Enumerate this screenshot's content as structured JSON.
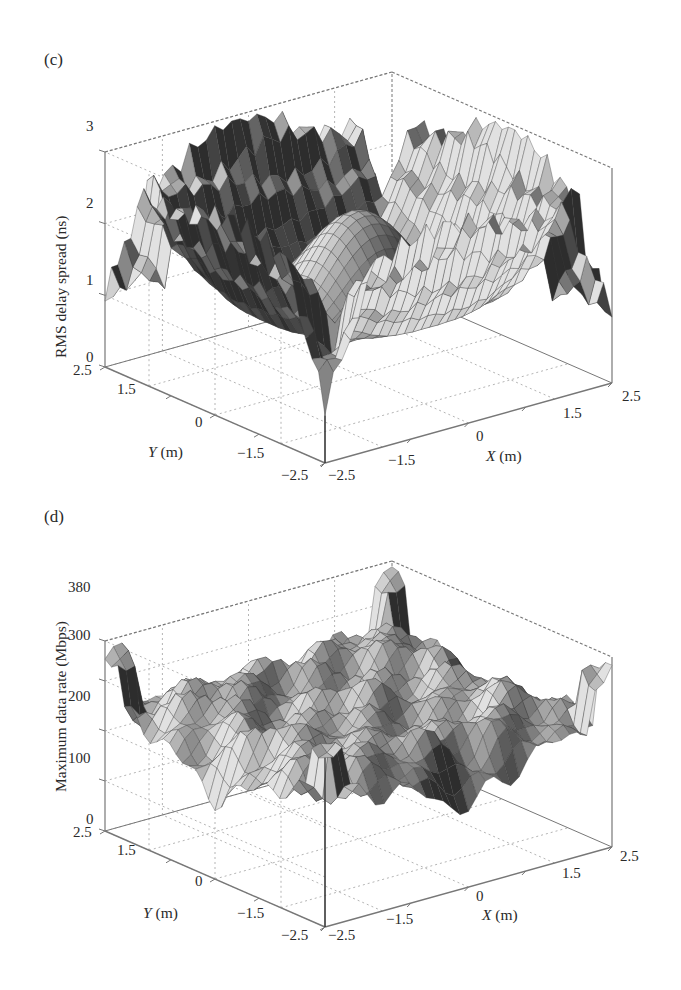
{
  "chart_data": [
    {
      "type": "surface3d",
      "panel": "(c)",
      "title": "",
      "xlabel": "X (m)",
      "ylabel": "Y (m)",
      "zlabel": "RMS delay spread (ns)",
      "x_ticks": [
        "-2.5",
        "-1.5",
        "0",
        "1.5",
        "2.5"
      ],
      "y_ticks": [
        "2.5",
        "1.5",
        "0",
        "-1.5",
        "-2.5"
      ],
      "z_ticks": [
        "0",
        "1",
        "2",
        "3"
      ],
      "xlim": [
        -2.5,
        2.5
      ],
      "ylim": [
        -2.5,
        2.5
      ],
      "zlim": [
        0,
        3
      ],
      "grid": true,
      "colormap": "grayscale",
      "description": "Symmetric surface; high walls (~2.5-3 ns) near room edges centered on each side, ring-shaped ridge (~2-2.3 ns) around center, central dip (~1.7 ns), deep notches near corners and edge midpoints (down to ~0.2 ns).",
      "sample_values": {
        "center": 1.7,
        "ring_peak": 2.3,
        "edge_mid_wall": 2.9,
        "corner": 0.9,
        "min_notch": 0.2
      }
    },
    {
      "type": "surface3d",
      "panel": "(d)",
      "title": "",
      "xlabel": "X (m)",
      "ylabel": "Y (m)",
      "zlabel": "Maximum data rate (Mbps)",
      "x_ticks": [
        "-2.5",
        "-1.5",
        "0",
        "1.5",
        "2.5"
      ],
      "y_ticks": [
        "2.5",
        "1.5",
        "0",
        "-1.5",
        "-2.5"
      ],
      "z_ticks": [
        "0",
        "100",
        "200",
        "300",
        "380"
      ],
      "xlim": [
        -2.5,
        2.5
      ],
      "ylim": [
        -2.5,
        2.5
      ],
      "zlim": [
        0,
        380
      ],
      "grid": true,
      "colormap": "grayscale",
      "description": "Rough plateau ~250-300 Mbps across the room, ripples toward edges, sharp spikes up to ~380 Mbps at corners, dips near edge midpoints down to ~130-150 Mbps.",
      "sample_values": {
        "center": 260,
        "plateau": 280,
        "corner_peak": 380,
        "edge_dip": 140,
        "min_notch": 120
      }
    }
  ],
  "panels": {
    "c": {
      "label": "(c)",
      "zlabel": "RMS delay spread (ns)",
      "z_ticks": [
        "3",
        "2",
        "1",
        "0"
      ],
      "y_ticks": [
        "2.5",
        "1.5",
        "0",
        "−1.5",
        "−2.5"
      ],
      "x_ticks": [
        "−2.5",
        "−1.5",
        "0",
        "1.5",
        "2.5"
      ],
      "xlabel_var": "X",
      "xlabel_unit": " (m)",
      "ylabel_var": "Y",
      "ylabel_unit": " (m)"
    },
    "d": {
      "label": "(d)",
      "zlabel": "Maximum data rate (Mbps)",
      "z_ticks": [
        "380",
        "300",
        "200",
        "100",
        "0"
      ],
      "y_ticks": [
        "2.5",
        "1.5",
        "0",
        "−1.5",
        "−2.5"
      ],
      "x_ticks": [
        "−2.5",
        "−1.5",
        "0",
        "1.5",
        "2.5"
      ],
      "xlabel_var": "X",
      "xlabel_unit": " (m)",
      "ylabel_var": "Y",
      "ylabel_unit": " (m)"
    }
  },
  "colors": {
    "axis": "#777777",
    "grid": "#b5b5b5",
    "surface_dark": "#2b2b2b",
    "surface_light": "#d8d8d8",
    "edge": "#3a3a3a"
  }
}
